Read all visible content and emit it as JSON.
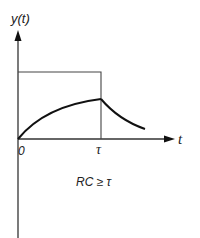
{
  "diagram": {
    "y_axis_label": "y(t)",
    "x_axis_label": "t",
    "origin_label": "0",
    "tau_label": "τ",
    "condition_label": "RC ≥ τ",
    "colors": {
      "line": "#333333",
      "curve": "#111111",
      "background": "#ffffff"
    }
  }
}
